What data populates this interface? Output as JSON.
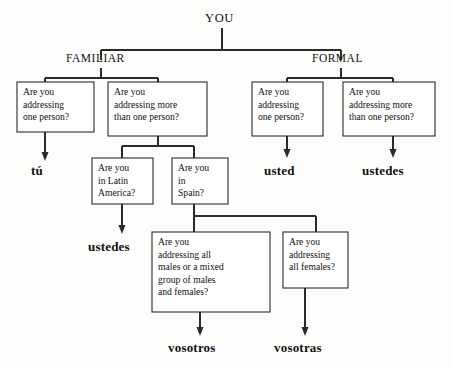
{
  "diagram": {
    "title_text": "YOU",
    "branches": {
      "familiar": "FAMILIAR",
      "formal": "FORMAL"
    },
    "questions": {
      "q_fam_one": {
        "lines": [
          "Are you",
          "addressing",
          "one person?"
        ]
      },
      "q_fam_more": {
        "lines": [
          "Are you",
          "addressing more",
          "than one person?"
        ]
      },
      "q_form_one": {
        "lines": [
          "Are you",
          "addressing",
          "one person?"
        ]
      },
      "q_form_more": {
        "lines": [
          "Are you",
          "addressing more",
          "than one person?"
        ]
      },
      "q_latin": {
        "lines": [
          "Are you",
          "in Latin",
          "America?"
        ]
      },
      "q_spain": {
        "lines": [
          "Are you",
          "in",
          "Spain?"
        ]
      },
      "q_males": {
        "lines": [
          "Are you",
          "addressing all",
          "males or a mixed",
          "group of males",
          "and females?"
        ]
      },
      "q_females": {
        "lines": [
          "Are you",
          "addressing",
          "all females?"
        ]
      }
    },
    "answers": {
      "tu": "tú",
      "ustedes_latin": "ustedes",
      "usted": "usted",
      "ustedes_formal": "ustedes",
      "vosotros": "vosotros",
      "vosotras": "vosotras"
    },
    "colors": {
      "line": "#2b2b2b",
      "box_fill": "#ffffff",
      "text": "#111111",
      "background": "#fdfdfb"
    }
  }
}
